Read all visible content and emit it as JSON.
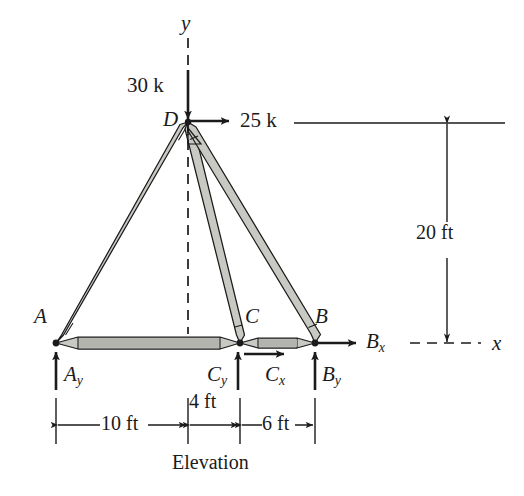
{
  "figure": {
    "caption": "Elevation",
    "type": "structural-truss-free-body-diagram"
  },
  "axes": {
    "y_label": "y",
    "x_label": "x"
  },
  "nodes": [
    {
      "id": "A",
      "label": "A",
      "x": 56,
      "y": 343
    },
    {
      "id": "B",
      "label": "B",
      "x": 315,
      "y": 343
    },
    {
      "id": "C",
      "label": "C",
      "x": 240,
      "y": 343
    },
    {
      "id": "D",
      "label": "D",
      "x": 188,
      "y": 121
    }
  ],
  "members": [
    {
      "from": "D",
      "to": "A"
    },
    {
      "from": "D",
      "to": "C"
    },
    {
      "from": "D",
      "to": "B"
    },
    {
      "from": "A",
      "to": "C"
    },
    {
      "from": "C",
      "to": "B"
    }
  ],
  "applied_loads": [
    {
      "label": "30 k",
      "magnitude": 30,
      "unit": "k",
      "at": "D",
      "direction": "down"
    },
    {
      "label": "25 k",
      "magnitude": 25,
      "unit": "k",
      "at": "D",
      "direction": "right"
    }
  ],
  "reactions": [
    {
      "label": "A",
      "sub": "y",
      "at": "A",
      "direction": "up"
    },
    {
      "label": "C",
      "sub": "y",
      "at": "C",
      "direction": "up"
    },
    {
      "label": "C",
      "sub": "x",
      "at": "C",
      "direction": "right"
    },
    {
      "label": "B",
      "sub": "y",
      "at": "B",
      "direction": "up"
    },
    {
      "label": "B",
      "sub": "x",
      "at": "B",
      "direction": "right"
    }
  ],
  "dimensions": [
    {
      "label": "10 ft",
      "value": 10,
      "unit": "ft",
      "span": "A to y-axis",
      "orientation": "horizontal"
    },
    {
      "label": "4 ft",
      "value": 4,
      "unit": "ft",
      "span": "y-axis to C",
      "orientation": "horizontal"
    },
    {
      "label": "6 ft",
      "value": 6,
      "unit": "ft",
      "span": "C to B",
      "orientation": "horizontal"
    },
    {
      "label": "20 ft",
      "value": 20,
      "unit": "ft",
      "span": "D to baseline",
      "orientation": "vertical"
    }
  ],
  "colors": {
    "line": "#1b1b1b",
    "member_fill": "#c9c9c4",
    "member_fill_dark": "#b4b4ae",
    "background": "#ffffff"
  }
}
